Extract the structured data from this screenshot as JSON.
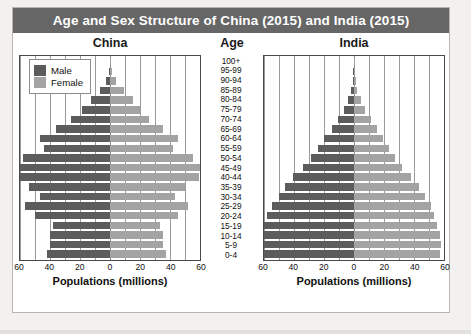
{
  "title": "Age and Sex Structure of China (2015) and India (2015)",
  "columns": {
    "left": "China",
    "center": "Age",
    "right": "India"
  },
  "legend": {
    "male": "Male",
    "female": "Female"
  },
  "axis_title": "Populations (millions)",
  "colors": {
    "male": "#5c5c5c",
    "female": "#a3a3a3",
    "title_bar": "#666666",
    "frame": "#4a4a4a",
    "grid": "#9b9b9b",
    "page_background": "#f2f1ef"
  },
  "chart_data": {
    "type": "bar",
    "subtype": "population-pyramid",
    "title": "Age and Sex Structure of China (2015) and India (2015)",
    "xlabel": "Populations (millions)",
    "ylabel": "Age",
    "xlim": [
      -60,
      60
    ],
    "xticks": [
      60,
      40,
      20,
      0,
      20,
      40,
      60
    ],
    "grid": true,
    "legend_position": "top-left (China panel)",
    "categories": [
      "0-4",
      "5-9",
      "10-14",
      "15-19",
      "20-24",
      "25-29",
      "30-34",
      "35-39",
      "40-44",
      "45-49",
      "50-54",
      "55-59",
      "60-64",
      "65-69",
      "70-74",
      "75-79",
      "80-84",
      "85-89",
      "90-94",
      "95-99",
      "100+"
    ],
    "panels": [
      {
        "name": "China",
        "year": 2015,
        "series": [
          {
            "name": "Male",
            "values": [
              42,
              40,
              40,
              38,
              50,
              57,
              47,
              54,
              64,
              72,
              58,
              44,
              47,
              36,
              26,
              19,
              13,
              7,
              3,
              1,
              0.3
            ]
          },
          {
            "name": "Female",
            "values": [
              37,
              35,
              35,
              33,
              45,
              52,
              43,
              50,
              59,
              67,
              55,
              42,
              45,
              35,
              26,
              20,
              15,
              9,
              4,
              1.3,
              0.4
            ]
          }
        ]
      },
      {
        "name": "India",
        "year": 2015,
        "series": [
          {
            "name": "Male",
            "values": [
              61,
              62,
              62,
              61,
              58,
              55,
              50,
              46,
              41,
              34,
              29,
              24,
              20,
              15,
              11,
              7,
              4,
              2,
              1,
              0.4,
              0.15
            ]
          },
          {
            "name": "Female",
            "values": [
              57,
              58,
              57,
              55,
              53,
              51,
              47,
              43,
              38,
              32,
              27,
              23,
              19,
              15,
              11,
              7,
              4.5,
              2.3,
              1,
              0.4,
              0.15
            ]
          }
        ]
      }
    ]
  }
}
